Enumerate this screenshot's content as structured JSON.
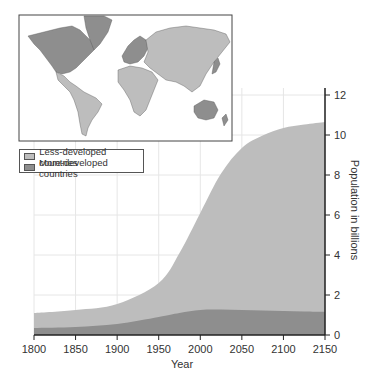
{
  "chart_data": {
    "type": "area",
    "stacked": true,
    "title": "",
    "xlabel": "Year",
    "ylabel": "Population in billions",
    "x": [
      1800,
      1850,
      1900,
      1950,
      1975,
      2000,
      2025,
      2050,
      2075,
      2100,
      2125,
      2150
    ],
    "series": [
      {
        "name": "More-developed countries",
        "color": "#8e8e8e",
        "values": [
          0.35,
          0.4,
          0.55,
          0.9,
          1.1,
          1.25,
          1.27,
          1.25,
          1.22,
          1.2,
          1.17,
          1.15
        ]
      },
      {
        "name": "Less-developed countries",
        "color": "#bdbdbd",
        "values": [
          0.75,
          0.85,
          1.0,
          1.7,
          3.0,
          4.85,
          6.8,
          8.1,
          8.75,
          9.15,
          9.35,
          9.5
        ]
      }
    ],
    "totals": [
      1.1,
      1.25,
      1.55,
      2.6,
      4.1,
      6.1,
      8.07,
      9.35,
      9.97,
      10.35,
      10.52,
      10.65
    ],
    "xticks": [
      1800,
      1850,
      1900,
      1950,
      2000,
      2050,
      2100,
      2150
    ],
    "yticks": [
      0,
      2,
      4,
      6,
      8,
      10,
      12
    ],
    "xlim": [
      1800,
      2150
    ],
    "ylim": [
      0,
      12
    ],
    "grid": true,
    "y_axis_position": "right",
    "legend_position": "upper-left",
    "inset": "World map: more-developed countries (dark gray) vs. less-developed countries (light gray)"
  },
  "legend": {
    "items": [
      {
        "label": "Less-developed countries",
        "color": "#bdbdbd"
      },
      {
        "label": "More-developed countries",
        "color": "#8e8e8e"
      }
    ]
  },
  "axes": {
    "x_title": "Year",
    "y_title": "Population in billions"
  }
}
